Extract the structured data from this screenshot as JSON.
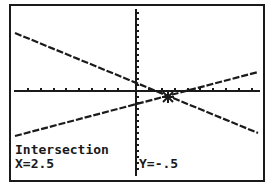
{
  "screen": {
    "title_label": "Intersection",
    "x_readout": "X=2.5",
    "y_readout": "Y=-.5",
    "colors": {
      "pixel": "#1a1a1a",
      "background": "#ffffff"
    }
  },
  "graph": {
    "axes": {
      "x_axis_visible": true,
      "y_axis_visible": true,
      "tick_marks": true
    },
    "lines": [
      {
        "name": "line-1",
        "direction": "decreasing",
        "start": [
          -9.4,
          4.8
        ],
        "end": [
          9.4,
          -3.5
        ]
      },
      {
        "name": "line-2",
        "direction": "increasing",
        "start": [
          -9.4,
          -3.7
        ],
        "end": [
          9.4,
          1.6
        ]
      }
    ],
    "intersection": {
      "x": 2.5,
      "y": -0.5
    }
  }
}
